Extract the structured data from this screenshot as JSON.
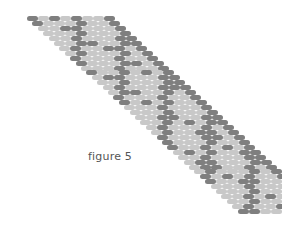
{
  "figure": {
    "caption": "figure 5",
    "colors": {
      "light": "#c8c8c8",
      "dark": "#7f7f7f",
      "background": "#ffffff"
    },
    "layout": {
      "start_x": 27,
      "start_y": 16,
      "bead_w": 11,
      "bead_h": 5,
      "row_shift_x": 5.4,
      "row_shift_y": 4.95,
      "beads_per_row": 8,
      "rows": 40
    },
    "pattern_description": "Diagonal band of brick-stitch beads in light and dark gray forming repeating zig-zag/diamond motif"
  }
}
